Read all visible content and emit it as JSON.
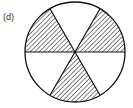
{
  "figure": {
    "label": "(d)",
    "sectors_total": 6,
    "sectors_shaded": 3,
    "shaded_sectors": [
      "upper-left",
      "upper-right",
      "bottom"
    ],
    "colors": {
      "stroke": "#111111",
      "hatch": "#222222",
      "background": "#ffffff"
    }
  }
}
